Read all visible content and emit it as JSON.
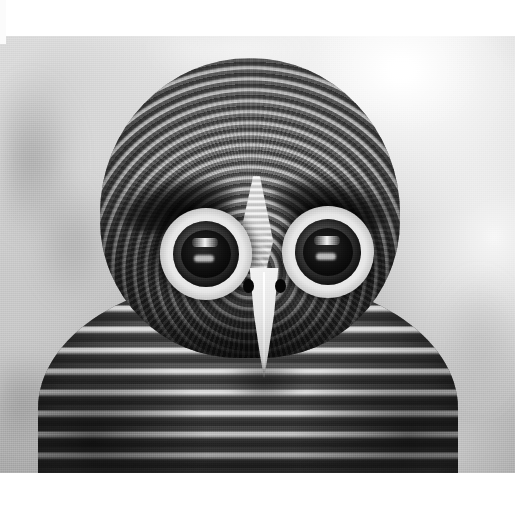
{
  "image": {
    "title": "Owl portrait",
    "subject": "owl",
    "orientation": "landscape",
    "color_mode": "grayscale",
    "width_px": 532,
    "height_px": 505,
    "photo_area": {
      "left_px": 0,
      "top_px": 36,
      "width_px": 515,
      "height_px": 437
    },
    "margins": {
      "top_px": 36,
      "right_px": 17,
      "bottom_px": 32,
      "left_px": 0,
      "color": "#ffffff"
    }
  },
  "scene": {
    "description": "Close-up frontal head-and-shoulders portrait of a barred owl staring directly at the camera",
    "background": {
      "type": "blurred-bokeh",
      "tone": "light-gray",
      "bright_region": "upper-right",
      "dark_region": "lower-left",
      "highlight_color": "#fdfdfd",
      "midtone_color": "#c6c6c6",
      "shadow_color": "#a0a0a0"
    },
    "lighting": "soft frontal light, brightest at top-right"
  },
  "subject": {
    "common_name": "owl",
    "pose": "facing camera, head centered",
    "parts": [
      {
        "name": "crown",
        "pattern": "fine concentric barring",
        "tone": "dark gray"
      },
      {
        "name": "facial-disc",
        "pattern": "radial feather streaks",
        "tone": "mid gray"
      },
      {
        "name": "brow-marking-left",
        "pattern": "solid dark band",
        "tone": "near black"
      },
      {
        "name": "brow-marking-right",
        "pattern": "solid dark band",
        "tone": "near black"
      },
      {
        "name": "forehead-stripe",
        "pattern": "pale V-shaped barred wedge",
        "tone": "cream white"
      },
      {
        "name": "eye-left",
        "pattern": "bright ring with dark round pupil",
        "tone": "white ring / black pupil"
      },
      {
        "name": "eye-right",
        "pattern": "bright ring with dark round pupil",
        "tone": "white ring / black pupil"
      },
      {
        "name": "beak",
        "pattern": "smooth pale hooked bill",
        "tone": "ivory"
      },
      {
        "name": "nostrils",
        "pattern": "two dark ovals",
        "tone": "black"
      },
      {
        "name": "breast",
        "pattern": "heavy horizontal barring",
        "tone": "alternating light and dark gray"
      },
      {
        "name": "shoulders",
        "pattern": "barred plumage fading to shadow",
        "tone": "dark gray"
      }
    ],
    "eye_count": 2,
    "eye_expression": "wide, alert, direct gaze"
  },
  "palette": {
    "white": "#ffffff",
    "highlight": "#f4f4f4",
    "light_gray": "#d3d3d3",
    "mid_gray": "#9c9c9c",
    "dark_gray": "#4a4a4a",
    "near_black": "#121212",
    "beak_ivory": "#f3eee2"
  }
}
